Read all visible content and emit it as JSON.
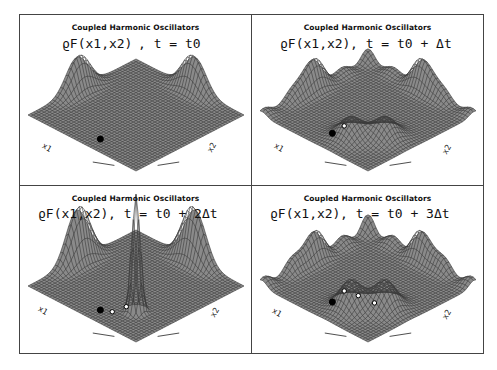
{
  "figure": {
    "panels": [
      {
        "title": "Coupled Harmonic Oscillators",
        "formula_lhs": "ϱF(x1,x2)",
        "formula_rhs": ",  t  =  t0",
        "time_step": "t0",
        "axis_x1": "x1",
        "axis_x2": "x2",
        "surface": {
          "left_peak": 0.9,
          "right_peak": 0.9,
          "inner_bump": 0.0,
          "center_spike": 0.0,
          "ripple": 0.0,
          "trajectory_points": 1
        }
      },
      {
        "title": "Coupled Harmonic Oscillators",
        "formula_lhs": "ϱF(x1,x2)",
        "formula_rhs": ",  t  =  t0  +  Δt",
        "time_step": "t0 + Δt",
        "axis_x1": "x1",
        "axis_x2": "x2",
        "surface": {
          "left_peak": 0.7,
          "right_peak": 0.7,
          "inner_bump": 0.5,
          "center_spike": 0.0,
          "ripple": 0.4,
          "trajectory_points": 2
        }
      },
      {
        "title": "Coupled Harmonic Oscillators",
        "formula_lhs": "ϱF(x1,x2)",
        "formula_rhs": ",  t  =  t0  +   2Δt",
        "time_step": "t0 + 2Δt",
        "axis_x1": "x1",
        "axis_x2": "x2",
        "surface": {
          "left_peak": 1.4,
          "right_peak": 1.4,
          "inner_bump": 0.0,
          "center_spike": 1.8,
          "ripple": 0.0,
          "trajectory_points": 3
        }
      },
      {
        "title": "Coupled Harmonic Oscillators",
        "formula_lhs": "ϱF(x1,x2)",
        "formula_rhs": ",  t  =  t0  +   3Δt",
        "time_step": "t0 + 3Δt",
        "axis_x1": "x1",
        "axis_x2": "x2",
        "surface": {
          "left_peak": 0.6,
          "right_peak": 0.6,
          "inner_bump": 0.7,
          "center_spike": 0.0,
          "ripple": 0.6,
          "trajectory_points": 4
        }
      }
    ]
  },
  "colors": {
    "ink": "#111111",
    "mesh_dark": "#3a3a3a",
    "mesh_light": "#ffffff",
    "frame": "#444444"
  }
}
